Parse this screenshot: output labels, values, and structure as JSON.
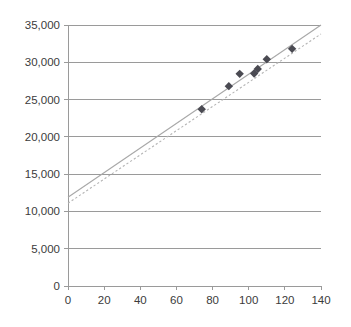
{
  "chart_data": {
    "type": "scatter",
    "title": "",
    "subtitle": "",
    "xlabel": "",
    "ylabel": "",
    "xlim": [
      0,
      140
    ],
    "ylim": [
      0,
      35000
    ],
    "grid": "horizontal",
    "legend": "none",
    "x_ticks": [
      0,
      20,
      40,
      60,
      80,
      100,
      120,
      140
    ],
    "x_tick_labels": [
      "0",
      "20",
      "40",
      "60",
      "80",
      "100",
      "120",
      "140"
    ],
    "y_ticks": [
      0,
      5000,
      10000,
      15000,
      20000,
      25000,
      30000,
      35000
    ],
    "y_tick_labels": [
      "0",
      "5,000",
      "10,000",
      "15,000",
      "20,000",
      "25,000",
      "30,000",
      "35,000"
    ],
    "series": [
      {
        "name": "data-points",
        "kind": "scatter",
        "marker": "diamond",
        "color": "#4a4a52",
        "points": [
          {
            "x": 74,
            "y": 23700
          },
          {
            "x": 89,
            "y": 26800
          },
          {
            "x": 95,
            "y": 28450
          },
          {
            "x": 103,
            "y": 28500
          },
          {
            "x": 105,
            "y": 29100
          },
          {
            "x": 110,
            "y": 30400
          },
          {
            "x": 124,
            "y": 31800
          }
        ]
      },
      {
        "name": "trend-line-solid",
        "kind": "line",
        "style": "solid",
        "color": "#a8a8a8",
        "points": [
          {
            "x": 0,
            "y": 11900
          },
          {
            "x": 140,
            "y": 35000
          }
        ]
      },
      {
        "name": "trend-line-dotted",
        "kind": "line",
        "style": "dotted",
        "color": "#b4b4b4",
        "points": [
          {
            "x": 0,
            "y": 11100
          },
          {
            "x": 140,
            "y": 33800
          }
        ]
      }
    ]
  },
  "colors": {
    "background": "#ffffff",
    "grid": "#9a9a9a",
    "axis": "#9a9a9a",
    "marker": "#4a4a52",
    "trend_solid": "#a8a8a8",
    "trend_dotted": "#b4b4b4",
    "tick_text": "#3b3b3b"
  },
  "y_axis": {
    "labels": [
      "35,000",
      "30,000",
      "25,000",
      "20,000",
      "15,000",
      "10,000",
      "5,000",
      "0"
    ]
  },
  "x_axis": {
    "labels": [
      "0",
      "20",
      "40",
      "60",
      "80",
      "100",
      "120",
      "140"
    ]
  }
}
